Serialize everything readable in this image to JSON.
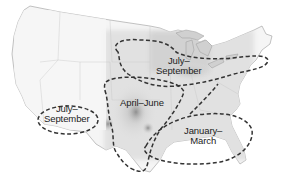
{
  "map": {
    "title": "",
    "subject": "Seasonal regions of the contiguous United States",
    "colors": {
      "land": "#f4f4f4",
      "land_shaded": "#d9d9d9",
      "land_dark": "#9a9a9a",
      "lakes": "#cfcfcf",
      "border": "#8a8a8a",
      "dashed_outline": "#3a3a3a",
      "label_text": "#222222"
    },
    "regions": [
      {
        "id": "north-central",
        "line1": "July–",
        "line2": "September"
      },
      {
        "id": "southwest",
        "line1": "July–",
        "line2": "September"
      },
      {
        "id": "central-plains",
        "line1": "April–June",
        "line2": ""
      },
      {
        "id": "southeast",
        "line1": "January–",
        "line2": "March"
      }
    ]
  }
}
